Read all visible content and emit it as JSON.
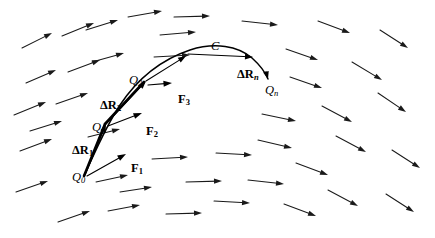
{
  "figure": {
    "background_color": "#ffffff",
    "ink_color": "#000000",
    "field_color": "#1a1a1a"
  },
  "labels": {
    "curve": {
      "text": "C",
      "style": "italic",
      "x": 211,
      "y": 40
    },
    "points": [
      {
        "name": "Q0",
        "base": "Q",
        "sub": "0",
        "sub_style": "italic",
        "x": 72,
        "y": 171
      },
      {
        "name": "Q1",
        "base": "Q",
        "sub": "1",
        "sub_style": "italic",
        "x": 92,
        "y": 121
      },
      {
        "name": "Q2",
        "base": "Q",
        "sub": "2",
        "sub_style": "italic",
        "x": 129,
        "y": 74
      },
      {
        "name": "Qn",
        "base": "Q",
        "sub": "n",
        "sub_style": "italic",
        "x": 265,
        "y": 84
      }
    ],
    "displacements": [
      {
        "name": "dR1",
        "base": "ΔR",
        "sub": "1",
        "sub_style": "upright",
        "x": 72,
        "y": 144
      },
      {
        "name": "dR2",
        "base": "ΔR",
        "sub": "2",
        "sub_style": "upright",
        "x": 100,
        "y": 99
      },
      {
        "name": "dRn",
        "base": "ΔR",
        "sub": "n",
        "sub_style": "italic",
        "x": 237,
        "y": 68
      }
    ],
    "forces": [
      {
        "name": "F1",
        "base": "F",
        "sub": "1",
        "sub_style": "upright",
        "x": 131,
        "y": 162
      },
      {
        "name": "F2",
        "base": "F",
        "sub": "2",
        "sub_style": "upright",
        "x": 146,
        "y": 125
      },
      {
        "name": "F3",
        "base": "F",
        "sub": "3",
        "sub_style": "upright",
        "x": 178,
        "y": 93
      }
    ]
  },
  "curve": {
    "name": "curve-C",
    "path": "M 84 176 C 96 150 106 126 120 105 C 136 81 160 60 190 50 C 215 42 238 46 252 58 C 262 67 266 74 268 79"
  },
  "chords": [
    {
      "name": "chord-Q0-Q1",
      "x1": 84,
      "y1": 176,
      "x2": 105,
      "y2": 124
    },
    {
      "name": "chord-Q1-Q2",
      "x1": 105,
      "y1": 124,
      "x2": 144,
      "y2": 82
    }
  ],
  "chord_arrows": [
    {
      "name": "chord-arrow-Q0-Q1",
      "x1": 85,
      "y1": 175,
      "x2": 106,
      "y2": 124
    },
    {
      "name": "chord-arrow-Q1-Q2",
      "x1": 106,
      "y1": 124,
      "x2": 146,
      "y2": 81
    },
    {
      "name": "chord-arrow-Q2-Q3",
      "x1": 146,
      "y1": 81,
      "x2": 186,
      "y2": 56
    },
    {
      "name": "chord-arrow-Qn",
      "x1": 188,
      "y1": 54,
      "x2": 253,
      "y2": 57
    }
  ],
  "force_vectors": [
    {
      "name": "force-vector-F1",
      "x1": 87,
      "y1": 176,
      "x2": 126,
      "y2": 154
    },
    {
      "name": "force-vector-F2",
      "x1": 108,
      "y1": 126,
      "x2": 142,
      "y2": 113
    },
    {
      "name": "force-vector-F3",
      "x1": 148,
      "y1": 85,
      "x2": 172,
      "y2": 83
    }
  ],
  "field_arrows": [
    {
      "x1": 22,
      "y1": 48,
      "x2": 52,
      "y2": 33
    },
    {
      "x1": 26,
      "y1": 83,
      "x2": 56,
      "y2": 70
    },
    {
      "x1": 14,
      "y1": 115,
      "x2": 46,
      "y2": 102
    },
    {
      "x1": 20,
      "y1": 151,
      "x2": 52,
      "y2": 139
    },
    {
      "x1": 16,
      "y1": 192,
      "x2": 48,
      "y2": 181
    },
    {
      "x1": 58,
      "y1": 222,
      "x2": 90,
      "y2": 211
    },
    {
      "x1": 62,
      "y1": 36,
      "x2": 94,
      "y2": 23
    },
    {
      "x1": 68,
      "y1": 72,
      "x2": 100,
      "y2": 60
    },
    {
      "x1": 56,
      "y1": 104,
      "x2": 88,
      "y2": 93
    },
    {
      "x1": 86,
      "y1": 30,
      "x2": 118,
      "y2": 20
    },
    {
      "x1": 92,
      "y1": 62,
      "x2": 124,
      "y2": 53
    },
    {
      "x1": 30,
      "y1": 131,
      "x2": 62,
      "y2": 121
    },
    {
      "x1": 88,
      "y1": 137,
      "x2": 120,
      "y2": 129
    },
    {
      "x1": 96,
      "y1": 182,
      "x2": 128,
      "y2": 175
    },
    {
      "x1": 108,
      "y1": 211,
      "x2": 140,
      "y2": 205
    },
    {
      "x1": 128,
      "y1": 17,
      "x2": 162,
      "y2": 11
    },
    {
      "x1": 160,
      "y1": 35,
      "x2": 196,
      "y2": 32
    },
    {
      "x1": 154,
      "y1": 57,
      "x2": 190,
      "y2": 55
    },
    {
      "x1": 120,
      "y1": 192,
      "x2": 152,
      "y2": 187
    },
    {
      "x1": 174,
      "y1": 17,
      "x2": 210,
      "y2": 16
    },
    {
      "x1": 152,
      "y1": 159,
      "x2": 188,
      "y2": 157
    },
    {
      "x1": 186,
      "y1": 182,
      "x2": 222,
      "y2": 181
    },
    {
      "x1": 166,
      "y1": 214,
      "x2": 202,
      "y2": 213
    },
    {
      "x1": 216,
      "y1": 153,
      "x2": 252,
      "y2": 155
    },
    {
      "x1": 214,
      "y1": 201,
      "x2": 250,
      "y2": 203
    },
    {
      "x1": 248,
      "y1": 180,
      "x2": 284,
      "y2": 184
    },
    {
      "x1": 242,
      "y1": 21,
      "x2": 278,
      "y2": 25
    },
    {
      "x1": 262,
      "y1": 114,
      "x2": 296,
      "y2": 121
    },
    {
      "x1": 258,
      "y1": 140,
      "x2": 292,
      "y2": 148
    },
    {
      "x1": 286,
      "y1": 49,
      "x2": 318,
      "y2": 60
    },
    {
      "x1": 290,
      "y1": 77,
      "x2": 322,
      "y2": 88
    },
    {
      "x1": 296,
      "y1": 163,
      "x2": 328,
      "y2": 175
    },
    {
      "x1": 284,
      "y1": 204,
      "x2": 316,
      "y2": 216
    },
    {
      "x1": 318,
      "y1": 21,
      "x2": 350,
      "y2": 33
    },
    {
      "x1": 322,
      "y1": 106,
      "x2": 352,
      "y2": 122
    },
    {
      "x1": 336,
      "y1": 136,
      "x2": 366,
      "y2": 152
    },
    {
      "x1": 328,
      "y1": 190,
      "x2": 358,
      "y2": 206
    },
    {
      "x1": 352,
      "y1": 62,
      "x2": 382,
      "y2": 80
    },
    {
      "x1": 380,
      "y1": 30,
      "x2": 408,
      "y2": 48
    },
    {
      "x1": 378,
      "y1": 93,
      "x2": 406,
      "y2": 112
    },
    {
      "x1": 392,
      "y1": 150,
      "x2": 420,
      "y2": 168
    },
    {
      "x1": 386,
      "y1": 194,
      "x2": 414,
      "y2": 212
    }
  ]
}
